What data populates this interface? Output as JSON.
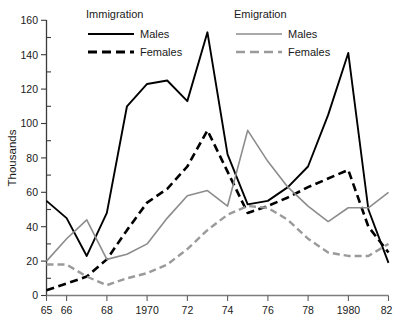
{
  "chart_data": {
    "type": "line",
    "title": "",
    "subtitle": "",
    "xlabel": "",
    "ylabel": "Thousands",
    "xlim": [
      1965,
      1982
    ],
    "ylim": [
      0,
      160
    ],
    "grid": false,
    "legend_position": "top",
    "x": [
      1965,
      1966,
      1967,
      1968,
      1969,
      1970,
      1971,
      1972,
      1973,
      1974,
      1975,
      1976,
      1977,
      1978,
      1979,
      1980,
      1981,
      1982
    ],
    "x_tick_values": [
      1965,
      1966,
      1968,
      1970,
      1972,
      1974,
      1976,
      1978,
      1980,
      1982
    ],
    "x_tick_labels": [
      "65",
      "66",
      "68",
      "1970",
      "72",
      "74",
      "76",
      "78",
      "1980",
      "82"
    ],
    "y_tick_values": [
      0,
      20,
      40,
      60,
      80,
      100,
      120,
      140,
      160
    ],
    "y_tick_labels": [
      "0",
      "20",
      "40",
      "60",
      "80",
      "100",
      "120",
      "140",
      "160"
    ],
    "y_minor_tick_values": [
      10,
      30,
      50,
      70,
      90,
      110,
      130,
      150
    ],
    "series": [
      {
        "name": "Immigration Males",
        "group": "Immigration",
        "label": "Males",
        "style": "solid",
        "color": "#000000",
        "width": 1.9,
        "values": [
          55,
          45,
          23,
          48,
          110,
          123,
          125,
          113,
          153,
          82,
          53,
          55,
          63,
          75,
          105,
          141,
          50,
          19
        ]
      },
      {
        "name": "Immigration Females",
        "group": "Immigration",
        "label": "Females",
        "style": "dashed",
        "color": "#000000",
        "width": 2.6,
        "values": [
          3,
          7,
          11,
          21,
          38,
          54,
          62,
          75,
          96,
          72,
          48,
          52,
          57,
          63,
          68,
          73,
          40,
          25
        ]
      },
      {
        "name": "Emigration Males",
        "group": "Emigration",
        "label": "Males",
        "style": "solid",
        "color": "#8c8c8c",
        "width": 1.6,
        "values": [
          20,
          33,
          44,
          21,
          24,
          30,
          45,
          58,
          61,
          52,
          96,
          78,
          63,
          52,
          43,
          51,
          51,
          60
        ]
      },
      {
        "name": "Emigration Females",
        "group": "Emigration",
        "label": "Females",
        "style": "dashed",
        "color": "#9a9a9a",
        "width": 2.4,
        "values": [
          18,
          18,
          11,
          6,
          10,
          13,
          18,
          27,
          38,
          47,
          52,
          51,
          44,
          33,
          25,
          23,
          23,
          30
        ]
      }
    ],
    "legends": [
      {
        "title": "Immigration",
        "entries": [
          {
            "label": "Males",
            "style": "solid",
            "color": "#000000"
          },
          {
            "label": "Females",
            "style": "dashed",
            "color": "#000000"
          }
        ]
      },
      {
        "title": "Emigration",
        "entries": [
          {
            "label": "Males",
            "style": "solid",
            "color": "#8c8c8c"
          },
          {
            "label": "Females",
            "style": "dashed",
            "color": "#9a9a9a"
          }
        ]
      }
    ]
  },
  "axis": {
    "y_title": "Thousands",
    "y_labels": {
      "t0": "0",
      "t20": "20",
      "t40": "40",
      "t60": "60",
      "t80": "80",
      "t100": "100",
      "t120": "120",
      "t140": "140",
      "t160": "160"
    },
    "x_labels": {
      "t65": "65",
      "t66": "66",
      "t68": "68",
      "t70": "1970",
      "t72": "72",
      "t74": "74",
      "t76": "76",
      "t78": "78",
      "t80": "1980",
      "t82": "82"
    }
  },
  "legend_immigration": {
    "title": "Immigration",
    "males": "Males",
    "females": "Females"
  },
  "legend_emigration": {
    "title": "Emigration",
    "males": "Males",
    "females": "Females"
  }
}
